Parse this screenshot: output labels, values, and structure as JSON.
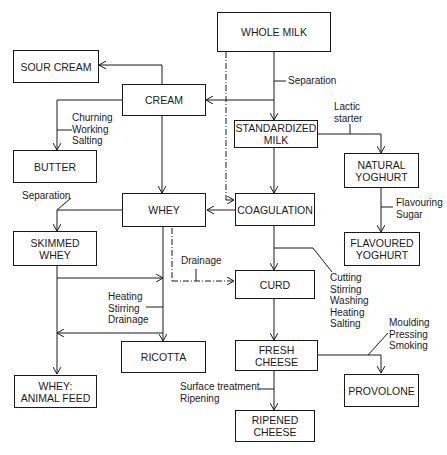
{
  "nodes": {
    "whole_milk": "WHOLE MILK",
    "sour_cream": "SOUR CREAM",
    "cream": "CREAM",
    "standardized_milk": "STANDARDIZED\nMILK",
    "butter": "BUTTER",
    "natural_yoghurt": "NATURAL\nYOGHURT",
    "whey": "WHEY",
    "coagulation": "COAGULATION",
    "skimmed_whey": "SKIMMED\nWHEY",
    "flavoured_yoghurt": "FLAVOURED\nYOGHURT",
    "curd": "CURD",
    "ricotta": "RICOTTA",
    "fresh_cheese": "FRESH CHEESE",
    "whey_animal_feed": "WHEY:\nANIMAL FEED",
    "provolone": "PROVOLONE",
    "ripened_cheese": "RIPENED\nCHEESE"
  },
  "labels": {
    "separation_milk": "Separation",
    "churning": "Churning\nWorking\nSalting",
    "lactic_starter": "Lactic\nstarter",
    "separation_whey": "Separation",
    "flavouring": "Flavouring\nSugar",
    "drainage": "Drainage",
    "cutting": "Cutting\nStirring\nWashing\nHeating\nSalting",
    "heating": "Heating\nStirring\nDrainage",
    "moulding": "Moulding\nPressing\nSmoking",
    "surface": "Surface treatment\nRipening"
  }
}
